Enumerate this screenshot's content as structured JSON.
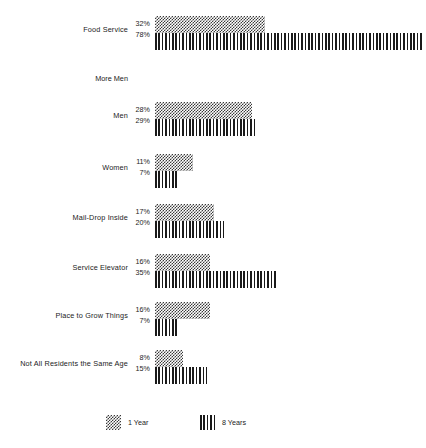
{
  "chart_data": {
    "type": "bar",
    "orientation": "horizontal",
    "title": "",
    "xlabel": "",
    "ylabel": "",
    "grid": false,
    "xlim": [
      0,
      100
    ],
    "units": "percent",
    "legend_position": "bottom",
    "categories": [
      "Food Service",
      "Men",
      "Women",
      "Mail-Drop Inside",
      "Service Elevator",
      "Place to Grow Things",
      "Not All Residents the Same Age"
    ],
    "series": [
      {
        "name": "1 Year",
        "pattern": "dots",
        "values": [
          32,
          28,
          11,
          17,
          16,
          16,
          8
        ]
      },
      {
        "name": "8 Years",
        "pattern": "stripes",
        "values": [
          78,
          29,
          7,
          20,
          35,
          7,
          15
        ]
      }
    ],
    "annotations": [
      {
        "text": "More Men",
        "after_category": "Food Service"
      }
    ]
  },
  "rows": [
    {
      "label": "Food Service",
      "v1": "32%",
      "v2": "78%",
      "w1": 32,
      "w2": 78
    },
    {
      "label": "Men",
      "v1": "28%",
      "v2": "29%",
      "w1": 28,
      "w2": 29
    },
    {
      "label": "Women",
      "v1": "11%",
      "v2": "7%",
      "w1": 11,
      "w2": 7
    },
    {
      "label": "Mail-Drop Inside",
      "v1": "17%",
      "v2": "20%",
      "w1": 17,
      "w2": 20
    },
    {
      "label": "Service Elevator",
      "v1": "16%",
      "v2": "35%",
      "w1": 16,
      "w2": 35
    },
    {
      "label": "Place to Grow Things",
      "v1": "16%",
      "v2": "7%",
      "w1": 16,
      "w2": 7
    },
    {
      "label": "Not All Residents the Same Age",
      "v1": "8%",
      "v2": "15%",
      "w1": 8,
      "w2": 15
    }
  ],
  "section_note": {
    "label": "More Men"
  },
  "legend": {
    "items": [
      {
        "label": "1 Year",
        "pattern": "dots"
      },
      {
        "label": "8 Years",
        "pattern": "stripes"
      }
    ]
  },
  "style": {
    "background": "#ffffff",
    "ink": "#1c1c1c",
    "bar_dots_color": "#3a3a3a",
    "bar_stripes_color": "#1a1a1a"
  },
  "layout": {
    "bar_origin_x": 155,
    "px_per_percent": 3.45,
    "row_tops": [
      14,
      100,
      152,
      202,
      252,
      300,
      348
    ],
    "section_note_top": 74
  }
}
